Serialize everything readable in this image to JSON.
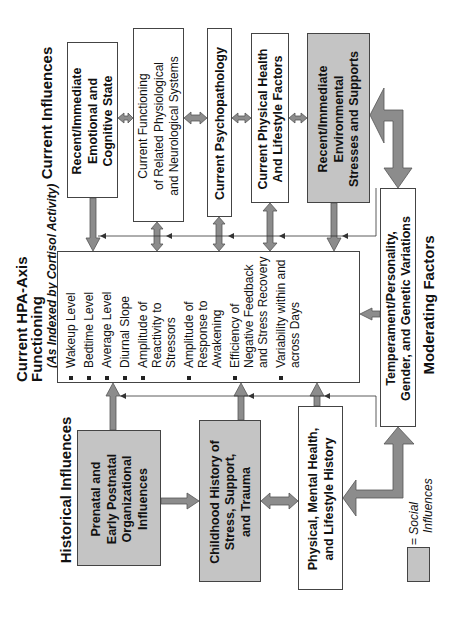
{
  "headings": {
    "current_influences": "Current Influences",
    "hpa_title": "Current HPA-Axis Functioning",
    "hpa_subtitle": "(As Indexed by Cortisol Activity)",
    "historical_influences": "Historical Influences",
    "moderating_factors": "Moderating Factors"
  },
  "current_boxes": [
    {
      "lines": [
        "Recent/Immediate",
        "Emotional and",
        "Cognitive State"
      ],
      "social": false
    },
    {
      "lines": [
        "Current Functioning",
        "of Related Physiological",
        "and Neurological Systems"
      ],
      "social": false
    },
    {
      "lines": [
        "Current Psychopathology"
      ],
      "social": false
    },
    {
      "lines": [
        "Current Physical Health",
        "And Lifestyle Factors"
      ],
      "social": false
    },
    {
      "lines": [
        "Recent/Immediate",
        "Environmental",
        "Stresses and Supports"
      ],
      "social": true
    }
  ],
  "hpa_measures": [
    "Wakeup Level",
    "Bedtime Level",
    "Average Level",
    "Diurnal Slope",
    "Amplitude of Reactivity to Stressors",
    "Amplitude of Response to Awakening",
    "Efficiency of Negative Feedback and Stress Recovery",
    "Variability within and across Days"
  ],
  "historical_boxes": [
    {
      "lines": [
        "Prenatal and",
        "Early Postnatal",
        "Organizational",
        "Influences"
      ],
      "social": true
    },
    {
      "lines": [
        "Childhood History of",
        "Stress, Support,",
        "and Trauma"
      ],
      "social": true
    },
    {
      "lines": [
        "Physical, Mental Health,",
        "and Lifestyle History"
      ],
      "social": false
    }
  ],
  "moderating_box": {
    "lines": [
      "Temperament/Personality,",
      "Gender, and Genetic Variations"
    ]
  },
  "legend": {
    "symbol": "= ",
    "label_line1": "Social",
    "label_line2": "Influences",
    "swatch_color": "#c4c4c4"
  },
  "colors": {
    "social_fill": "#c4c4c4",
    "arrow_fill": "#8c8c8c",
    "border": "#444444"
  }
}
